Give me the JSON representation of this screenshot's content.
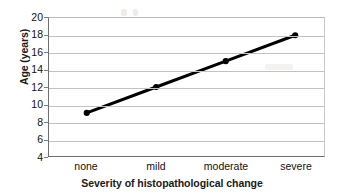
{
  "chart_data": {
    "type": "line",
    "title": "",
    "xlabel": "Severity of histopathological change",
    "ylabel": "Age (years)",
    "categories": [
      "none",
      "mild",
      "moderate",
      "severe"
    ],
    "values": [
      9,
      12,
      15,
      18
    ],
    "series": [
      {
        "name": "Age",
        "values": [
          9,
          12,
          15,
          18
        ]
      }
    ],
    "ylim": [
      4,
      20
    ],
    "yticks": [
      20,
      18,
      16,
      14,
      12,
      10,
      8,
      6,
      4
    ],
    "ytick_labels": [
      "20",
      "18",
      "16",
      "14",
      "12",
      "10",
      "8",
      "6",
      "4"
    ],
    "grid": "horizontal",
    "legend": "none",
    "line_color": "#000000",
    "marker": "filled-circle",
    "marker_color": "#000000",
    "gridline_color": "#c2c2c2",
    "background_color": "#ffffff"
  }
}
